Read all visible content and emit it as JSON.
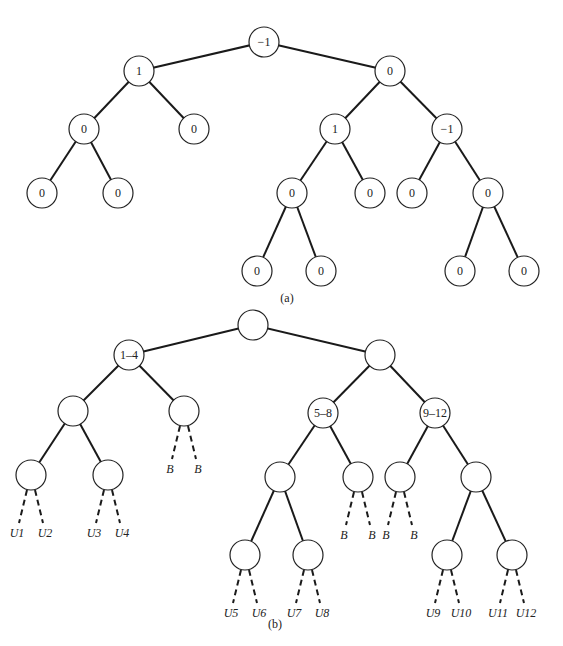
{
  "diagram_a": {
    "caption": "(a)",
    "nodes": [
      {
        "id": "a0",
        "x": 264,
        "y": 42,
        "label": "−1"
      },
      {
        "id": "a1",
        "x": 139,
        "y": 71,
        "label": "1"
      },
      {
        "id": "a2",
        "x": 390,
        "y": 71,
        "label": "0"
      },
      {
        "id": "a3",
        "x": 84,
        "y": 129,
        "label": "0"
      },
      {
        "id": "a4",
        "x": 194,
        "y": 129,
        "label": "0"
      },
      {
        "id": "a5",
        "x": 335,
        "y": 129,
        "label": "1"
      },
      {
        "id": "a6",
        "x": 447,
        "y": 129,
        "label": "−1"
      },
      {
        "id": "a7",
        "x": 42,
        "y": 193,
        "label": "0"
      },
      {
        "id": "a8",
        "x": 118,
        "y": 193,
        "label": "0"
      },
      {
        "id": "a9",
        "x": 292,
        "y": 193,
        "label": "0"
      },
      {
        "id": "a10",
        "x": 370,
        "y": 193,
        "label": "0"
      },
      {
        "id": "a11",
        "x": 412,
        "y": 193,
        "label": "0"
      },
      {
        "id": "a12",
        "x": 488,
        "y": 193,
        "label": "0"
      },
      {
        "id": "a13",
        "x": 257,
        "y": 271,
        "label": "0"
      },
      {
        "id": "a14",
        "x": 321,
        "y": 271,
        "label": "0"
      },
      {
        "id": "a15",
        "x": 460,
        "y": 271,
        "label": "0"
      },
      {
        "id": "a16",
        "x": 524,
        "y": 271,
        "label": "0"
      }
    ],
    "edges": [
      [
        "a0",
        "a1"
      ],
      [
        "a0",
        "a2"
      ],
      [
        "a1",
        "a3"
      ],
      [
        "a1",
        "a4"
      ],
      [
        "a2",
        "a5"
      ],
      [
        "a2",
        "a6"
      ],
      [
        "a3",
        "a7"
      ],
      [
        "a3",
        "a8"
      ],
      [
        "a5",
        "a9"
      ],
      [
        "a5",
        "a10"
      ],
      [
        "a6",
        "a11"
      ],
      [
        "a6",
        "a12"
      ],
      [
        "a9",
        "a13"
      ],
      [
        "a9",
        "a14"
      ],
      [
        "a12",
        "a15"
      ],
      [
        "a12",
        "a16"
      ]
    ]
  },
  "diagram_b": {
    "caption": "(b)",
    "nodes": [
      {
        "id": "b0",
        "x": 253,
        "y": 325,
        "label": ""
      },
      {
        "id": "b1",
        "x": 129,
        "y": 355,
        "label": "1–4"
      },
      {
        "id": "b2",
        "x": 380,
        "y": 355,
        "label": ""
      },
      {
        "id": "b3",
        "x": 73,
        "y": 411,
        "label": ""
      },
      {
        "id": "b4",
        "x": 184,
        "y": 411,
        "label": ""
      },
      {
        "id": "b5",
        "x": 323,
        "y": 413,
        "label": "5–8"
      },
      {
        "id": "b6",
        "x": 435,
        "y": 413,
        "label": "9–12"
      },
      {
        "id": "b7",
        "x": 31,
        "y": 475,
        "label": ""
      },
      {
        "id": "b8",
        "x": 108,
        "y": 475,
        "label": ""
      },
      {
        "id": "b9",
        "x": 280,
        "y": 477,
        "label": ""
      },
      {
        "id": "b10",
        "x": 358,
        "y": 477,
        "label": ""
      },
      {
        "id": "b11",
        "x": 400,
        "y": 477,
        "label": ""
      },
      {
        "id": "b12",
        "x": 476,
        "y": 477,
        "label": ""
      },
      {
        "id": "b13",
        "x": 245,
        "y": 555,
        "label": ""
      },
      {
        "id": "b14",
        "x": 308,
        "y": 555,
        "label": ""
      },
      {
        "id": "b15",
        "x": 447,
        "y": 555,
        "label": ""
      },
      {
        "id": "b16",
        "x": 512,
        "y": 555,
        "label": ""
      }
    ],
    "edges": [
      [
        "b0",
        "b1"
      ],
      [
        "b0",
        "b2"
      ],
      [
        "b1",
        "b3"
      ],
      [
        "b1",
        "b4"
      ],
      [
        "b2",
        "b5"
      ],
      [
        "b2",
        "b6"
      ],
      [
        "b3",
        "b7"
      ],
      [
        "b3",
        "b8"
      ],
      [
        "b5",
        "b9"
      ],
      [
        "b5",
        "b10"
      ],
      [
        "b6",
        "b11"
      ],
      [
        "b6",
        "b12"
      ],
      [
        "b9",
        "b13"
      ],
      [
        "b9",
        "b14"
      ],
      [
        "b12",
        "b15"
      ],
      [
        "b12",
        "b16"
      ]
    ],
    "dashed_leaves": [
      {
        "from": "b7",
        "label": "U1",
        "side": -1
      },
      {
        "from": "b7",
        "label": "U2",
        "side": 1
      },
      {
        "from": "b8",
        "label": "U3",
        "side": -1
      },
      {
        "from": "b8",
        "label": "U4",
        "side": 1
      },
      {
        "from": "b4",
        "label": "B",
        "side": -1
      },
      {
        "from": "b4",
        "label": "B",
        "side": 1
      },
      {
        "from": "b10",
        "label": "B",
        "side": -1
      },
      {
        "from": "b10",
        "label": "B",
        "side": 1
      },
      {
        "from": "b11",
        "label": "B",
        "side": -1
      },
      {
        "from": "b11",
        "label": "B",
        "side": 1
      },
      {
        "from": "b13",
        "label": "U5",
        "side": -1
      },
      {
        "from": "b13",
        "label": "U6",
        "side": 1
      },
      {
        "from": "b14",
        "label": "U7",
        "side": -1
      },
      {
        "from": "b14",
        "label": "U8",
        "side": 1
      },
      {
        "from": "b15",
        "label": "U9",
        "side": -1
      },
      {
        "from": "b15",
        "label": "U10",
        "side": 1
      },
      {
        "from": "b16",
        "label": "U11",
        "side": -1
      },
      {
        "from": "b16",
        "label": "U12",
        "side": 1
      }
    ]
  },
  "captions": {
    "a": "(a)",
    "b": "(b)"
  }
}
